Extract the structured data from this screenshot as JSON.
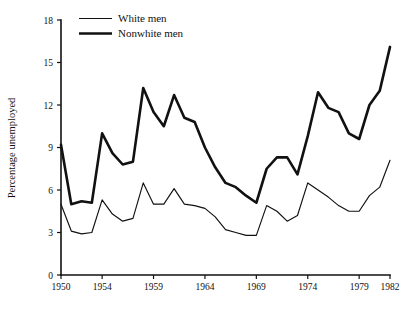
{
  "chart_data": {
    "type": "line",
    "title": "",
    "subtitle": "",
    "xlabel": "",
    "ylabel": "Percentage unemployed",
    "xlim": [
      1950,
      1982
    ],
    "ylim": [
      0,
      18
    ],
    "grid": false,
    "legend_position": "top-left",
    "x_ticks": [
      "1950",
      "1954",
      "1959",
      "1964",
      "1969",
      "1974",
      "1979",
      "1982"
    ],
    "x_tick_values": [
      1950,
      1954,
      1959,
      1964,
      1969,
      1974,
      1979,
      1982
    ],
    "y_ticks": [
      "0",
      "3",
      "6",
      "9",
      "12",
      "15",
      "18"
    ],
    "y_tick_values": [
      0,
      3,
      6,
      9,
      12,
      15,
      18
    ],
    "x": [
      1950,
      1951,
      1952,
      1953,
      1954,
      1955,
      1956,
      1957,
      1958,
      1959,
      1960,
      1961,
      1962,
      1963,
      1964,
      1965,
      1966,
      1967,
      1968,
      1969,
      1970,
      1971,
      1972,
      1973,
      1974,
      1975,
      1976,
      1977,
      1978,
      1979,
      1980,
      1981,
      1982
    ],
    "series": [
      {
        "name": "White men",
        "style": "thin",
        "color": "#111111",
        "values": [
          5.0,
          3.1,
          2.9,
          3.0,
          5.3,
          4.3,
          3.8,
          4.0,
          6.5,
          5.0,
          5.0,
          6.1,
          5.0,
          4.9,
          4.7,
          4.1,
          3.2,
          3.0,
          2.8,
          2.8,
          4.9,
          4.5,
          3.8,
          4.2,
          6.5,
          6.0,
          5.5,
          4.9,
          4.5,
          4.5,
          5.6,
          6.2,
          8.1
        ]
      },
      {
        "name": "Nonwhite men",
        "style": "thick",
        "color": "#111111",
        "values": [
          9.2,
          5.0,
          5.2,
          5.1,
          10.0,
          8.6,
          7.8,
          8.0,
          13.2,
          11.5,
          10.5,
          12.7,
          11.1,
          10.8,
          9.0,
          7.6,
          6.5,
          6.2,
          5.6,
          5.1,
          7.5,
          8.3,
          8.3,
          7.1,
          9.8,
          12.9,
          11.8,
          11.5,
          10.0,
          9.6,
          12.0,
          13.0,
          16.1
        ]
      }
    ],
    "legend": [
      {
        "label": "White men",
        "style": "thin"
      },
      {
        "label": "Nonwhite men",
        "style": "thick"
      }
    ]
  },
  "legend": {
    "item_0_label": "White men",
    "item_1_label": "Nonwhite men"
  },
  "axes": {
    "y_title": "Percentage unemployed",
    "y_tick_0": "0",
    "y_tick_1": "3",
    "y_tick_2": "6",
    "y_tick_3": "9",
    "y_tick_4": "12",
    "y_tick_5": "15",
    "y_tick_6": "18",
    "x_tick_0": "1950",
    "x_tick_1": "1954",
    "x_tick_2": "1959",
    "x_tick_3": "1964",
    "x_tick_4": "1969",
    "x_tick_5": "1974",
    "x_tick_6": "1979",
    "x_tick_7": "1982"
  }
}
